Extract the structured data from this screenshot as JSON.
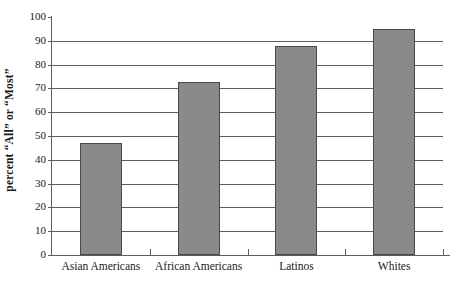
{
  "chart_data": {
    "type": "bar",
    "title": "",
    "xlabel": "",
    "ylabel": "percent “All” or “Most”",
    "categories": [
      "Asian Americans",
      "African Americans",
      "Latinos",
      "Whites"
    ],
    "values": [
      47,
      72.5,
      88,
      95
    ],
    "ylim": [
      0,
      100
    ],
    "ytick_labels": [
      "0",
      "10",
      "20",
      "30",
      "40",
      "50",
      "60",
      "70",
      "80",
      "90",
      "100"
    ],
    "ytick_values": [
      0,
      10,
      20,
      30,
      40,
      50,
      60,
      70,
      80,
      90,
      100
    ],
    "grid": true,
    "grid_axis": "y",
    "legend": "none",
    "bar_color": "#8a8a8a",
    "bar_edge_color": "#4a4a4a",
    "axis_color": "#5d5d5d",
    "background": "#ffffff"
  }
}
